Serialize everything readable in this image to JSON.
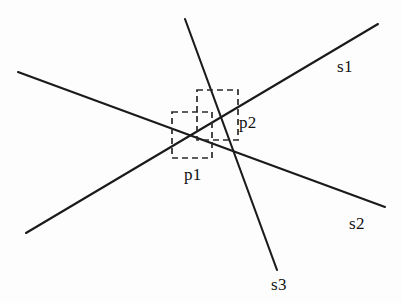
{
  "figure": {
    "background_color": "#fdfdfd",
    "stroke_color": "#1a1a1a",
    "dash_color": "#2a2a2a",
    "width": 402,
    "height": 303,
    "segments": [
      {
        "id": "s1",
        "label": "s1",
        "description": "line rising from lower-left to upper-right",
        "x1": 26,
        "y1": 233,
        "x2": 378,
        "y2": 24,
        "label_x": 337,
        "label_y": 58
      },
      {
        "id": "s2",
        "label": "s2",
        "description": "line descending from upper-left to lower-right",
        "x1": 18,
        "y1": 72,
        "x2": 385,
        "y2": 207,
        "label_x": 349,
        "label_y": 215
      },
      {
        "id": "s3",
        "label": "s3",
        "description": "steep line from top-center to bottom-center-right",
        "x1": 185,
        "y1": 19,
        "x2": 277,
        "y2": 270,
        "label_x": 271,
        "label_y": 276
      }
    ],
    "regions": [
      {
        "id": "p1",
        "label": "p1",
        "description": "lower-left dashed query box",
        "x": 172,
        "y": 112,
        "width": 40,
        "height": 46,
        "label_x": 184,
        "label_y": 166
      },
      {
        "id": "p2",
        "label": "p2",
        "description": "upper-right dashed query box",
        "x": 197,
        "y": 90,
        "width": 41,
        "height": 50,
        "label_x": 239,
        "label_y": 114
      }
    ]
  }
}
